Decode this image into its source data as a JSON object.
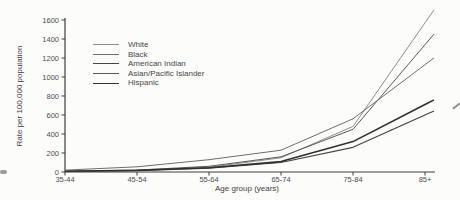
{
  "chart_data": {
    "type": "line",
    "title": "",
    "xlabel": "Age group (years)",
    "ylabel": "Rate per 100,000 population",
    "categories": [
      "35-44",
      "45-54",
      "55-64",
      "65-74",
      "75-84",
      "85+"
    ],
    "y_ticks": [
      0,
      200,
      400,
      600,
      800,
      1000,
      1200,
      1400,
      1600
    ],
    "ylim": [
      0,
      1600
    ],
    "grid": false,
    "legend_position": "upper-left-inside",
    "axis_color": "#3f3f3f",
    "series": [
      {
        "name": "White",
        "values": [
          5,
          15,
          50,
          150,
          480,
          1570
        ],
        "color": "#8f8f8f",
        "width": 1
      },
      {
        "name": "Black",
        "values": [
          20,
          55,
          130,
          230,
          560,
          1130
        ],
        "color": "#6e6e6e",
        "width": 1
      },
      {
        "name": "American Indian",
        "values": [
          5,
          14,
          40,
          100,
          260,
          600
        ],
        "color": "#454545",
        "width": 1.2
      },
      {
        "name": "Asian/Pacific Islander",
        "values": [
          8,
          20,
          60,
          160,
          450,
          1340
        ],
        "color": "#5a5a5a",
        "width": 1
      },
      {
        "name": "Hispanic",
        "values": [
          8,
          18,
          45,
          110,
          320,
          710
        ],
        "color": "#303030",
        "width": 1.6
      }
    ]
  }
}
